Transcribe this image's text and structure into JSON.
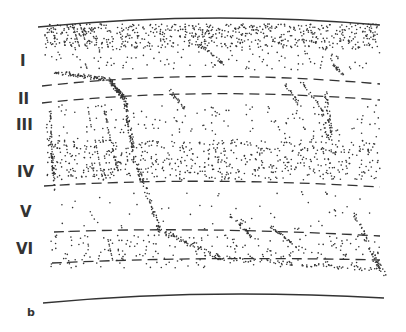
{
  "figure": {
    "panel_label": "b",
    "layers": [
      {
        "label": "I",
        "x": 20,
        "y": 52
      },
      {
        "label": "II",
        "x": 18,
        "y": 90
      },
      {
        "label": "III",
        "x": 16,
        "y": 116
      },
      {
        "label": "IV",
        "x": 17,
        "y": 163
      },
      {
        "label": "V",
        "x": 20,
        "y": 203
      },
      {
        "label": "VI",
        "x": 16,
        "y": 240
      }
    ],
    "colors": {
      "ink": "#333333",
      "background": "#ffffff"
    }
  }
}
